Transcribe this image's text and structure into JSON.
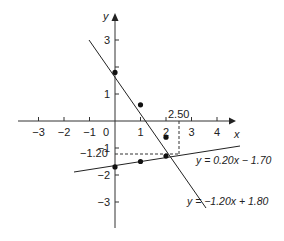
{
  "chart_data": {
    "type": "line",
    "title": "",
    "xlabel": "x",
    "ylabel": "y",
    "xlim": [
      -3.5,
      4.6
    ],
    "ylim": [
      -4,
      3.9
    ],
    "x_ticks": [
      "−3",
      "−2",
      "−1",
      "0",
      "1",
      "2",
      "3",
      "4"
    ],
    "y_ticks": [
      "3",
      "1",
      "−1",
      "−2",
      "−3"
    ],
    "grid": false,
    "series": [
      {
        "name": "y = −1.20x + 1.80",
        "slope": -1.2,
        "intercept": 1.8,
        "x_range": [
          -0.5,
          3.5
        ],
        "points": [
          [
            0,
            1.8
          ],
          [
            1,
            0.6
          ],
          [
            2,
            -0.6
          ]
        ]
      },
      {
        "name": "y = 0.20x − 1.70",
        "slope": 0.2,
        "intercept": -1.7,
        "x_range": [
          -1.5,
          4.5
        ],
        "points": [
          [
            0,
            -1.7
          ],
          [
            1,
            -1.5
          ],
          [
            2,
            -1.3
          ]
        ]
      }
    ],
    "annotations": [
      {
        "text": "2.50",
        "type": "x-marker",
        "x": 2.5
      },
      {
        "text": "−1.20",
        "type": "y-marker",
        "y": -1.2
      },
      {
        "text": "y = 0.20x − 1.70",
        "type": "line-label"
      },
      {
        "text": "y = −1.20x + 1.80",
        "type": "line-label"
      }
    ],
    "intersection": [
      2.5,
      -1.2
    ]
  },
  "labels": {
    "x_axis": "x",
    "y_axis": "y",
    "intersect_x": "2.50",
    "intersect_y": "−1.20",
    "eq1": "y = −1.20x + 1.80",
    "eq2": "y = 0.20x − 1.70"
  }
}
